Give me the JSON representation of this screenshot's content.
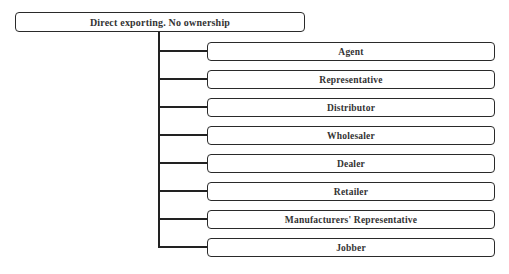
{
  "diagram": {
    "type": "tree",
    "root": {
      "label": "Direct exporting. No ownership"
    },
    "children": [
      {
        "label": "Agent"
      },
      {
        "label": "Representative"
      },
      {
        "label": "Distributor"
      },
      {
        "label": "Wholesaler"
      },
      {
        "label": "Dealer"
      },
      {
        "label": "Retailer"
      },
      {
        "label": "Manufacturers' Representative"
      },
      {
        "label": "Jobber"
      }
    ]
  }
}
